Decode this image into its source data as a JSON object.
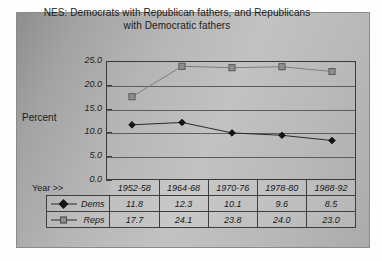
{
  "chart_data": {
    "type": "line",
    "title": "NES: Democrats with Republican fathers, and Republicans with Democratic fathers",
    "title_line1": "NES: Democrats with Republican fathers, and Republicans",
    "title_line2": "with Democratic fathers",
    "xlabel": "Year >>",
    "ylabel": "Percent",
    "ylim": [
      0.0,
      25.0
    ],
    "ytick_labels": [
      "25.0",
      "20.0",
      "15.0",
      "10.0",
      "5.0",
      "0.0"
    ],
    "ytick_values": [
      25.0,
      20.0,
      15.0,
      10.0,
      5.0,
      0.0
    ],
    "grid": true,
    "legend_position": "table-left",
    "categories": [
      "1952-58",
      "1964-68",
      "1970-76",
      "1978-80",
      "1988-92"
    ],
    "series": [
      {
        "name": "Dems",
        "marker": "diamond",
        "color": "#151515",
        "values": [
          11.8,
          12.3,
          10.1,
          9.6,
          8.5
        ],
        "value_labels": [
          "11.8",
          "12.3",
          "10.1",
          "9.6",
          "8.5"
        ]
      },
      {
        "name": "Reps",
        "marker": "square",
        "color": "#8d8d8d",
        "values": [
          17.7,
          24.1,
          23.8,
          24.0,
          23.0
        ],
        "value_labels": [
          "17.7",
          "24.1",
          "23.8",
          "24.0",
          "23.0"
        ]
      }
    ]
  },
  "colors": {
    "panel_gray": "#b6b6b6",
    "axis": "#3a3a3a",
    "grid": "#5d5d5d",
    "dems": "#151515",
    "reps": "#8d8d8d"
  }
}
